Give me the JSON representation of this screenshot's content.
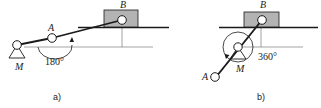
{
  "figure": {
    "panel_a": {
      "caption": "a)",
      "pivot_label": "M",
      "joint_label": "A",
      "slider_label": "B",
      "angle_label": "180°"
    },
    "panel_b": {
      "caption": "b)",
      "pivot_label": "M",
      "joint_label": "A",
      "slider_label": "B",
      "angle_label": "360°"
    },
    "colors": {
      "stroke": "#1a1a1a",
      "slider_fill": "#b3b3b3",
      "thin_line": "#555555"
    }
  }
}
